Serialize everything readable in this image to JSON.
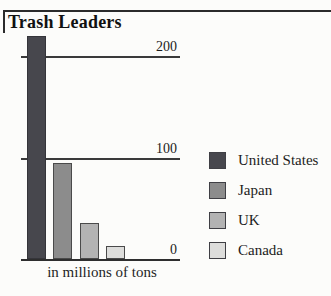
{
  "title": "Trash Leaders",
  "chart_data": {
    "type": "bar",
    "title": "Trash Leaders",
    "categories": [
      "United States",
      "Japan",
      "UK",
      "Canada"
    ],
    "values": [
      220,
      95,
      35,
      13
    ],
    "units_label": "in millions of tons",
    "xlabel": "",
    "ylabel": "millions of tons",
    "ylim": [
      0,
      220
    ],
    "yticks": [
      0,
      100,
      200
    ],
    "grid": "horizontal",
    "legend_position": "right",
    "bar_colors": [
      "#47474d",
      "#8c8c8c",
      "#b3b3b3",
      "#dddddb"
    ],
    "bar_border_color": "#4a4a4a",
    "axis_color": "#2e2e2e",
    "text_color": "#1c1c1c",
    "background_color": "#fcfcfa"
  }
}
